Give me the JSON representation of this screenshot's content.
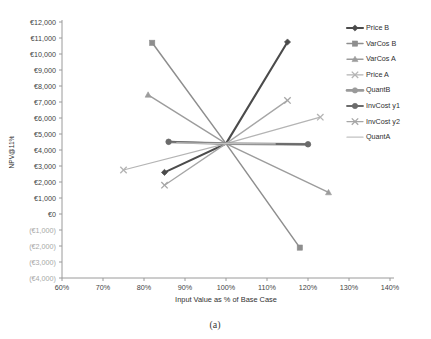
{
  "chart_data": {
    "type": "line",
    "title": "",
    "caption": "(a)",
    "xlabel": "Input Value as % of Base Case",
    "ylabel": "NPV@11%",
    "xlim": [
      60,
      140
    ],
    "ylim": [
      -4000,
      12000
    ],
    "grid": false,
    "legend_position": "right",
    "xticks": [
      "60%",
      "70%",
      "80%",
      "90%",
      "100%",
      "110%",
      "120%",
      "130%",
      "140%"
    ],
    "xtick_values": [
      60,
      70,
      80,
      90,
      100,
      110,
      120,
      130,
      140
    ],
    "yticks": [
      "€12,000",
      "€11,000",
      "€10,000",
      "€9,000",
      "€8,000",
      "€7,000",
      "€6,000",
      "€5,000",
      "€4,000",
      "€3,000",
      "€2,000",
      "€1,000",
      "€0",
      "(€1,000)",
      "(€2,000)",
      "(€3,000)",
      "(€4,000)"
    ],
    "ytick_values": [
      12000,
      11000,
      10000,
      9000,
      8000,
      7000,
      6000,
      5000,
      4000,
      3000,
      2000,
      1000,
      0,
      -1000,
      -2000,
      -3000,
      -4000
    ],
    "base_point": {
      "x": 100,
      "y": 4400
    },
    "series": [
      {
        "name": "Price B",
        "marker": "diamond",
        "color": "#4b4b4b",
        "width": 2.1,
        "x": [
          85,
          100,
          115
        ],
        "values": [
          2600,
          4400,
          10750
        ]
      },
      {
        "name": "VarCos B",
        "marker": "square",
        "color": "#8e8e8e",
        "width": 1.5,
        "x": [
          82,
          100,
          118
        ],
        "values": [
          10700,
          4400,
          -2100
        ]
      },
      {
        "name": "VarCos A",
        "marker": "triangle",
        "color": "#9c9c9c",
        "width": 1.4,
        "x": [
          81,
          100,
          125
        ],
        "values": [
          7450,
          4400,
          1350
        ]
      },
      {
        "name": "Price A",
        "marker": "cross",
        "color": "#b4b4b4",
        "width": 1.2,
        "x": [
          75,
          100,
          123
        ],
        "values": [
          2750,
          4400,
          6050
        ]
      },
      {
        "name": "QuantB",
        "marker": "circle",
        "color": "#9a9a9a",
        "width": 2.6,
        "x": [
          86,
          100,
          120
        ],
        "values": [
          4500,
          4400,
          4350
        ]
      },
      {
        "name": "InvCost y1",
        "marker": "circle",
        "color": "#6b6b6b",
        "width": 1.8,
        "x": [
          86,
          100,
          120
        ],
        "values": [
          4520,
          4400,
          4360
        ]
      },
      {
        "name": "InvCost y2",
        "marker": "cross",
        "color": "#a6a6a6",
        "width": 1.3,
        "x": [
          85,
          100,
          115
        ],
        "values": [
          1800,
          4400,
          7100
        ]
      },
      {
        "name": "QuantA",
        "marker": "none",
        "color": "#c2c2c2",
        "width": 1.3,
        "x": [
          88,
          100,
          112
        ],
        "values": [
          4450,
          4400,
          4380
        ]
      }
    ]
  },
  "legend": {
    "items": [
      {
        "label": "Price B"
      },
      {
        "label": "VarCos B"
      },
      {
        "label": "VarCos A"
      },
      {
        "label": "Price A"
      },
      {
        "label": "QuantB"
      },
      {
        "label": "InvCost y1"
      },
      {
        "label": "InvCost y2"
      },
      {
        "label": "QuantA"
      }
    ]
  }
}
